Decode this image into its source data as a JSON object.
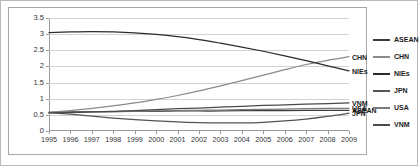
{
  "chart_data": {
    "type": "line",
    "title": "",
    "xlabel": "",
    "ylabel": "",
    "x": [
      1995,
      1996,
      1997,
      1998,
      1999,
      2000,
      2001,
      2002,
      2003,
      2004,
      2005,
      2006,
      2007,
      2008,
      2009
    ],
    "categories": [
      "1995",
      "1996",
      "1997",
      "1998",
      "1999",
      "2000",
      "2001",
      "2002",
      "2003",
      "2004",
      "2005",
      "2006",
      "2007",
      "2008",
      "2009"
    ],
    "ylim": [
      0,
      3.5
    ],
    "yticks": [
      "0",
      "0.5",
      "1",
      "1.5",
      "2",
      "2.5",
      "3",
      "3.5"
    ],
    "ytick_values": [
      0,
      0.5,
      1,
      1.5,
      2,
      2.5,
      3,
      3.5
    ],
    "grid": true,
    "legend_position": "right",
    "series": [
      {
        "name": "ASEAN",
        "color": "#3c3c3c",
        "values": [
          0.58,
          0.59,
          0.6,
          0.6,
          0.61,
          0.61,
          0.62,
          0.62,
          0.62,
          0.63,
          0.63,
          0.63,
          0.64,
          0.64,
          0.64
        ]
      },
      {
        "name": "CHN",
        "color": "#8a8a8a",
        "values": [
          0.58,
          0.63,
          0.7,
          0.78,
          0.87,
          0.98,
          1.1,
          1.24,
          1.4,
          1.56,
          1.73,
          1.9,
          2.06,
          2.19,
          2.3
        ]
      },
      {
        "name": "NIEs",
        "color": "#2b2b2b",
        "values": [
          3.05,
          3.07,
          3.08,
          3.07,
          3.04,
          2.99,
          2.92,
          2.83,
          2.72,
          2.6,
          2.47,
          2.33,
          2.18,
          2.02,
          1.86
        ]
      },
      {
        "name": "JPN",
        "color": "#545454",
        "values": [
          0.57,
          0.52,
          0.46,
          0.4,
          0.35,
          0.31,
          0.28,
          0.26,
          0.25,
          0.25,
          0.27,
          0.31,
          0.37,
          0.45,
          0.55
        ]
      },
      {
        "name": "USA",
        "color": "#7a7a7a",
        "values": [
          0.57,
          0.58,
          0.59,
          0.6,
          0.61,
          0.62,
          0.63,
          0.64,
          0.65,
          0.66,
          0.67,
          0.68,
          0.69,
          0.7,
          0.7
        ]
      },
      {
        "name": "VNM",
        "color": "#4a4a4a",
        "values": [
          0.56,
          0.57,
          0.59,
          0.61,
          0.63,
          0.66,
          0.69,
          0.71,
          0.74,
          0.76,
          0.79,
          0.81,
          0.83,
          0.85,
          0.87
        ]
      }
    ],
    "end_labels": [
      {
        "name": "CHN",
        "value": 2.3
      },
      {
        "name": "NIEs",
        "value": 1.86
      },
      {
        "name": "VNM",
        "value": 0.87
      },
      {
        "name": "USA",
        "value": 0.7
      },
      {
        "name": "ASEAN",
        "value": 0.64
      },
      {
        "name": "JPN",
        "value": 0.55
      }
    ]
  }
}
